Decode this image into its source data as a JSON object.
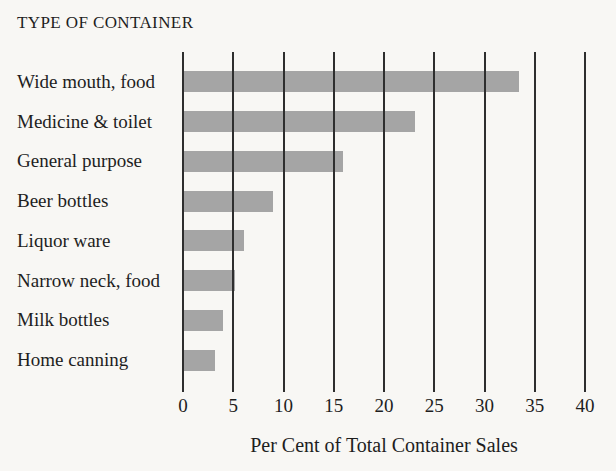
{
  "chart_data": {
    "type": "bar",
    "orientation": "horizontal",
    "title": "TYPE OF CONTAINER",
    "xlabel": "Per Cent of Total Container Sales",
    "categories": [
      "Wide mouth, food",
      "Medicine & toilet",
      "General purpose",
      "Beer bottles",
      "Liquor ware",
      "Narrow neck, food",
      "Milk bottles",
      "Home canning"
    ],
    "values": [
      33.4,
      23.1,
      15.9,
      9.0,
      6.1,
      5.2,
      4.0,
      3.2
    ],
    "xlim": [
      0,
      40
    ],
    "xticks": [
      0,
      5,
      10,
      15,
      20,
      25,
      30,
      35,
      40
    ],
    "grid": "vertical-lines-drawn-over-bars",
    "legend": "none",
    "colors": {
      "bar": "#a5a5a5",
      "gridline": "#2e2e2e",
      "text": "#1e1e1e",
      "background": "#f8f7f4"
    }
  }
}
